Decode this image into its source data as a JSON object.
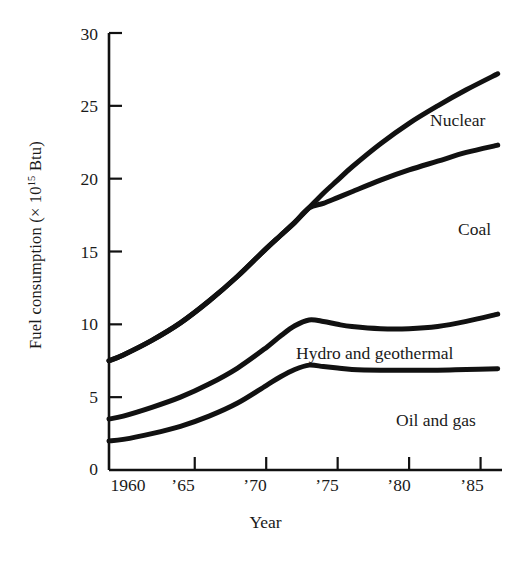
{
  "chart_data": {
    "type": "line",
    "title": "",
    "xlabel": "Year",
    "ylabel": "Fuel consumption (× 10¹⁵ Btu)",
    "ylabel_prefix": "Fuel consumption (× 10",
    "ylabel_exponent": "15",
    "ylabel_suffix": " Btu)",
    "xlim": [
      1959,
      1986.5
    ],
    "ylim": [
      0,
      30
    ],
    "grid": false,
    "legend_position": "inline-annotations",
    "yticks": [
      "0",
      "5",
      "10",
      "15",
      "20",
      "25",
      "30"
    ],
    "ytick_values": [
      0,
      5,
      10,
      15,
      20,
      25,
      30
    ],
    "xticks": [
      "1960",
      "’65",
      "’70",
      "’75",
      "’80",
      "’85"
    ],
    "xtick_values": [
      1960,
      1965,
      1970,
      1975,
      1980,
      1985
    ],
    "tick_direction": "inward",
    "line_color": "#111111",
    "line_width_px": 5,
    "x": [
      1959,
      1960,
      1962,
      1964,
      1966,
      1968,
      1970,
      1971,
      1972,
      1973,
      1974,
      1975,
      1976,
      1978,
      1980,
      1982,
      1984,
      1986.2
    ],
    "series": [
      {
        "name": "Nuclear",
        "label": "Nuclear",
        "note": "Total including nuclear; branches upward from the Coal curve at about 1973 (18 × 10¹⁵ Btu)",
        "x": [
          1959,
          1960,
          1962,
          1964,
          1966,
          1968,
          1970,
          1971,
          1972,
          1973,
          1974,
          1975,
          1976,
          1978,
          1980,
          1982,
          1984,
          1986.2
        ],
        "values": [
          7.5,
          7.9,
          8.9,
          10.1,
          11.6,
          13.3,
          15.2,
          16.1,
          17.0,
          18.0,
          19.0,
          19.9,
          20.8,
          22.4,
          23.8,
          25.0,
          26.1,
          27.2
        ]
      },
      {
        "name": "Coal",
        "label": "Coal",
        "note": "Branches downward from the shared curve at about 1973 (18 × 10¹⁵ Btu)",
        "x": [
          1959,
          1960,
          1962,
          1964,
          1966,
          1968,
          1970,
          1971,
          1972,
          1973,
          1974,
          1975,
          1976,
          1978,
          1980,
          1982,
          1984,
          1986.2
        ],
        "values": [
          7.5,
          7.9,
          8.9,
          10.1,
          11.6,
          13.3,
          15.2,
          16.1,
          17.0,
          18.0,
          18.3,
          18.7,
          19.1,
          19.9,
          20.6,
          21.2,
          21.8,
          22.3
        ]
      },
      {
        "name": "Hydro and geothermal",
        "label": "Hydro and geothermal",
        "x": [
          1959,
          1960,
          1962,
          1964,
          1966,
          1968,
          1970,
          1971,
          1972,
          1973,
          1974,
          1975,
          1976,
          1978,
          1980,
          1982,
          1984,
          1986.2
        ],
        "values": [
          3.5,
          3.7,
          4.3,
          5.0,
          5.9,
          7.0,
          8.4,
          9.2,
          9.9,
          10.3,
          10.2,
          10.0,
          9.85,
          9.7,
          9.7,
          9.85,
          10.2,
          10.7
        ]
      },
      {
        "name": "Oil and gas",
        "label": "Oil and gas",
        "x": [
          1959,
          1960,
          1962,
          1964,
          1966,
          1968,
          1970,
          1971,
          1972,
          1973,
          1974,
          1975,
          1976,
          1978,
          1980,
          1982,
          1984,
          1986.2
        ],
        "values": [
          2.0,
          2.1,
          2.5,
          3.0,
          3.7,
          4.6,
          5.8,
          6.4,
          6.9,
          7.2,
          7.1,
          7.0,
          6.9,
          6.85,
          6.85,
          6.85,
          6.9,
          6.95
        ]
      }
    ]
  }
}
